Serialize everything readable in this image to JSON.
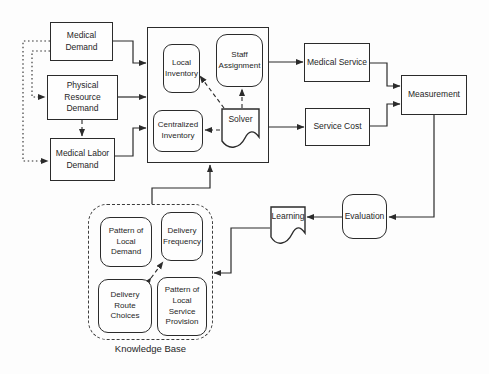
{
  "colors": {
    "background": "#fdfdfd",
    "line": "#2b2b2b",
    "text": "#262626"
  },
  "nodes": {
    "medical_demand": {
      "label": "Medical Demand"
    },
    "physical_resource_demand": {
      "label": "Physical Resource\nDemand"
    },
    "medical_labor_demand": {
      "label": "Medical Labor\nDemand"
    },
    "local_inventory": {
      "label": "Local\nInventory"
    },
    "staff_assignment": {
      "label": "Staff\nAssignment"
    },
    "centralized_inventory": {
      "label": "Centralized\nInventory"
    },
    "solver": {
      "label": "Solver"
    },
    "medical_service": {
      "label": "Medical Service"
    },
    "service_cost": {
      "label": "Service Cost"
    },
    "measurement": {
      "label": "Measurement"
    },
    "evaluation": {
      "label": "Evaluation"
    },
    "learning": {
      "label": "Learning"
    },
    "pattern_of_local_demand": {
      "label": "Pattern of\nLocal Demand"
    },
    "delivery_frequency": {
      "label": "Delivery\nFrequency"
    },
    "delivery_route_choices": {
      "label": "Delivery Route\nChoices"
    },
    "pattern_of_local_service_provision": {
      "label": "Pattern of\nLocal Service\nProvision"
    },
    "knowledge_base": {
      "label": "Knowledge Base"
    }
  },
  "edges": [
    {
      "from": "medical_demand",
      "to": "operations-system",
      "style": "solid"
    },
    {
      "from": "physical_resource_demand",
      "to": "operations-system",
      "style": "solid"
    },
    {
      "from": "medical_labor_demand",
      "to": "operations-system",
      "style": "solid"
    },
    {
      "from": "medical_demand",
      "to": "physical_resource_demand",
      "style": "dotted"
    },
    {
      "from": "medical_demand",
      "to": "medical_labor_demand",
      "style": "dotted"
    },
    {
      "from": "physical_resource_demand",
      "to": "medical_labor_demand",
      "style": "dashed"
    },
    {
      "from": "solver",
      "to": "local_inventory",
      "style": "dashed"
    },
    {
      "from": "solver",
      "to": "staff_assignment",
      "style": "dashed"
    },
    {
      "from": "solver",
      "to": "centralized_inventory",
      "style": "dashed"
    },
    {
      "from": "operations-system",
      "to": "medical_service",
      "style": "solid"
    },
    {
      "from": "operations-system",
      "to": "service_cost",
      "style": "solid"
    },
    {
      "from": "medical_service",
      "to": "measurement",
      "style": "solid"
    },
    {
      "from": "service_cost",
      "to": "measurement",
      "style": "solid"
    },
    {
      "from": "measurement",
      "to": "evaluation",
      "style": "solid"
    },
    {
      "from": "evaluation",
      "to": "learning",
      "style": "solid"
    },
    {
      "from": "learning",
      "to": "knowledge_base",
      "style": "solid"
    },
    {
      "from": "knowledge_base",
      "to": "operations-system",
      "style": "solid"
    },
    {
      "from": "delivery_route_choices",
      "to": "delivery_frequency",
      "style": "dashed",
      "bidirectional": true
    }
  ]
}
